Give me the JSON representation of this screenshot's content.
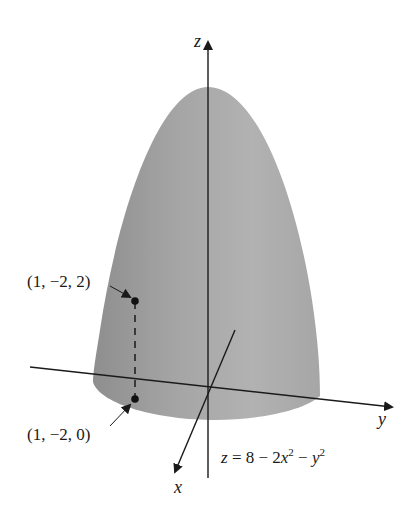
{
  "figure": {
    "type": "3d-surface-diagram",
    "surface_color": "#9a9a9a",
    "axis_color": "#1a1a1a"
  },
  "axes": {
    "z_label": "z",
    "y_label": "y",
    "x_label": "x"
  },
  "equation": {
    "lhs": "z",
    "rhs_prefix": "= 8 − 2",
    "var1": "x",
    "exp1": "2",
    "minus": " − ",
    "var2": "y",
    "exp2": "2"
  },
  "points": [
    {
      "label": "(1, −2, 2)"
    },
    {
      "label": "(1, −2, 0)"
    }
  ]
}
